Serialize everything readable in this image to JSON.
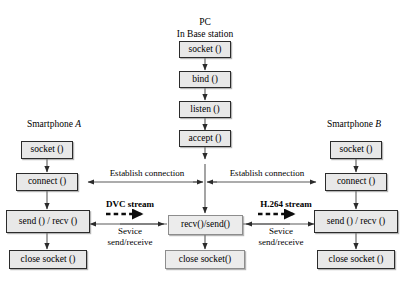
{
  "diagram": {
    "title_lines": [
      "PC",
      "In Base station"
    ],
    "left_group_label": "Smartphone A",
    "right_group_label": "Smartphone B",
    "center_nodes": [
      {
        "id": "pc-socket",
        "label": "socket ()"
      },
      {
        "id": "pc-bind",
        "label": "bind ()"
      },
      {
        "id": "pc-listen",
        "label": "listen ()"
      },
      {
        "id": "pc-accept",
        "label": "accept ()"
      },
      {
        "id": "pc-recv-send",
        "label": "recv()/send()"
      },
      {
        "id": "pc-close",
        "label": "close socket()"
      }
    ],
    "left_nodes": [
      {
        "id": "a-socket",
        "label": "socket ()"
      },
      {
        "id": "a-connect",
        "label": "connect ()"
      },
      {
        "id": "a-send-recv",
        "label": "send () / recv ()"
      },
      {
        "id": "a-close",
        "label": "close socket ()"
      }
    ],
    "right_nodes": [
      {
        "id": "b-socket",
        "label": "socket ()"
      },
      {
        "id": "b-connect",
        "label": "connect ()"
      },
      {
        "id": "b-send-recv",
        "label": "send () / recv ()"
      },
      {
        "id": "b-close",
        "label": "close socket ()"
      }
    ],
    "edge_labels": {
      "establish_left": "Establish connection",
      "establish_right": "Establish connection",
      "service_left_line1": "Sevice",
      "service_left_line2": "send/receive",
      "service_right_line1": "Sevice",
      "service_right_line2": "send/receive"
    },
    "stream_labels": {
      "left": "DVC stream",
      "right": "H.264 stream"
    },
    "colors": {
      "node_fill": "#e8e8e8",
      "node_border": "#2b2b2b",
      "line": "#4a4a4a",
      "text": "#000000",
      "background": "#ffffff"
    }
  }
}
